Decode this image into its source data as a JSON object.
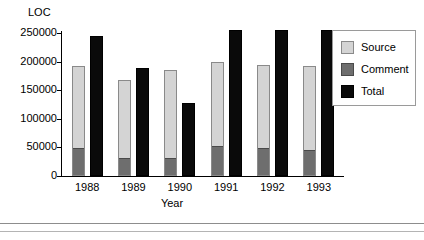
{
  "chart_data": {
    "type": "bar",
    "title": "",
    "xlabel": "Year",
    "ylabel": "LOC",
    "categories": [
      "1988",
      "1989",
      "1990",
      "1991",
      "1992",
      "1993"
    ],
    "ylim": [
      0,
      250000
    ],
    "yticks": [
      0,
      50000,
      100000,
      150000,
      200000,
      250000
    ],
    "ytick_labels": [
      "0",
      "50000",
      "100000",
      "150000",
      "200000",
      "250000"
    ],
    "grid": false,
    "legend_position": "right",
    "series": [
      {
        "name": "Source",
        "color": "#d4d4d4",
        "values": [
          193000,
          167000,
          186000,
          199000,
          194000,
          192000
        ]
      },
      {
        "name": "Comment",
        "color": "#6e6e6e",
        "values": [
          48000,
          30000,
          30000,
          50000,
          48000,
          43000
        ]
      },
      {
        "name": "Total",
        "color": "#0a0a0a",
        "values": [
          245000,
          188000,
          128000,
          256000,
          255000,
          256000
        ]
      }
    ]
  },
  "axes": {
    "y_title": "LOC",
    "x_title": "Year"
  },
  "legend": {
    "items": [
      {
        "label": "Source"
      },
      {
        "label": "Comment"
      },
      {
        "label": "Total"
      }
    ]
  }
}
